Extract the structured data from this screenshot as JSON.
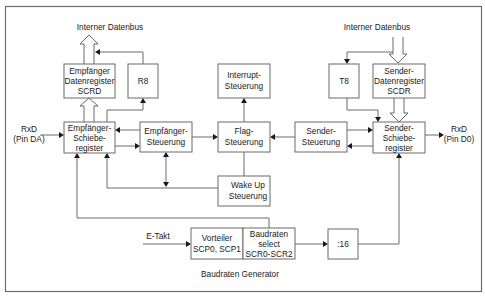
{
  "diagram": {
    "title": "Baudraten Generator",
    "labels": {
      "bus_left": "Interner Datenbus",
      "bus_right": "Interner Datenbus",
      "rxd_in_line1": "RxD",
      "rxd_in_line2": "(Pin DA)",
      "rxd_out_line1": "RxD",
      "rxd_out_line2": "(Pin D0)",
      "e_takt": "E-Takt",
      "baud_gen": "Baudraten Generator"
    },
    "blocks": {
      "scrd": {
        "lines": [
          "Empfänger",
          "Datenregister",
          "SCRD"
        ]
      },
      "r8": {
        "lines": [
          "R8"
        ]
      },
      "rx_shift": {
        "lines": [
          "Empfänger-",
          "Schiebe-",
          "register"
        ]
      },
      "rx_ctrl": {
        "lines": [
          "Empfänger-",
          "Steuerung"
        ]
      },
      "irq_ctrl": {
        "lines": [
          "Interrupt-",
          "Steuerung"
        ]
      },
      "flag_ctrl": {
        "lines": [
          "Flag-",
          "Steuerung"
        ]
      },
      "wake_ctrl": {
        "lines": [
          "Wake Up",
          "Steuerung"
        ]
      },
      "tx_ctrl": {
        "lines": [
          "Sender-",
          "Steuerung"
        ]
      },
      "t8": {
        "lines": [
          "T8"
        ]
      },
      "scdr": {
        "lines": [
          "Sender-",
          "Datenregister",
          "SCDR"
        ]
      },
      "tx_shift": {
        "lines": [
          "Sender-",
          "Schiebe-",
          "register"
        ]
      },
      "prescaler": {
        "lines": [
          "Vorteiler",
          "SCP0, SCP1"
        ]
      },
      "baud_select": {
        "lines": [
          "Baudraten",
          "select",
          "SCR0-SCR2"
        ]
      },
      "div16": {
        "lines": [
          ":16"
        ]
      }
    },
    "colors": {
      "stroke": "#6a6a6a",
      "text": "#1a1a1a",
      "background": "#ffffff"
    }
  }
}
